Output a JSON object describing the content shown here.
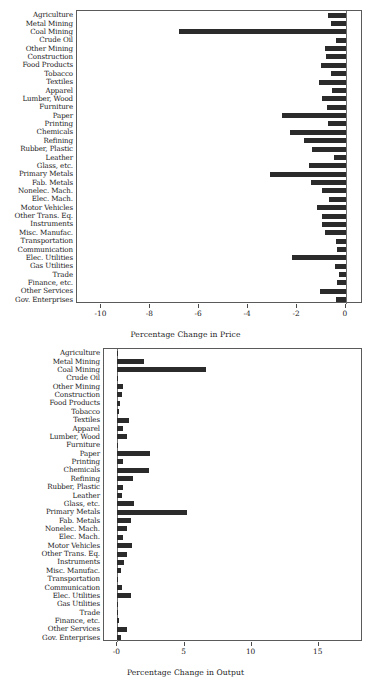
{
  "figure": {
    "background": "#ffffff",
    "bar_color": "#2b2b2b",
    "axis_color": "#5a5a5a"
  },
  "categories": [
    "Agriculture",
    "Metal Mining",
    "Coal Mining",
    "Crude Oil",
    "Other Mining",
    "Construction",
    "Food Products",
    "Tobacco",
    "Textiles",
    "Apparel",
    "Lumber, Wood",
    "Furniture",
    "Paper",
    "Printing",
    "Chemicals",
    "Refining",
    "Rubber, Plastic",
    "Leather",
    "Glass, etc.",
    "Primary Metals",
    "Fab. Metals",
    "Nonelec. Mach.",
    "Elec. Mach.",
    "Motor Vehicles",
    "Other Trans. Eq.",
    "Instruments",
    "Misc. Manufac.",
    "Transportation",
    "Communication",
    "Elec. Utilities",
    "Gas Utilities",
    "Trade",
    "Finance, etc.",
    "Other Services",
    "Gov. Enterprises"
  ],
  "chart_data": [
    {
      "type": "bar",
      "orientation": "horizontal",
      "id": "price",
      "title": "",
      "xlabel": "Percentage Change in Price",
      "ylabel": "",
      "xlim": [
        -11.0,
        0.7
      ],
      "xticks": [
        -10,
        -8,
        -6,
        -4,
        -2,
        0
      ],
      "xticklabels": [
        "-10",
        "-8",
        "-6",
        "-4",
        "-2",
        "0"
      ],
      "grid": false,
      "legend": null,
      "categories": [
        "Agriculture",
        "Metal Mining",
        "Coal Mining",
        "Crude Oil",
        "Other Mining",
        "Construction",
        "Food Products",
        "Tobacco",
        "Textiles",
        "Apparel",
        "Lumber, Wood",
        "Furniture",
        "Paper",
        "Printing",
        "Chemicals",
        "Refining",
        "Rubber, Plastic",
        "Leather",
        "Glass, etc.",
        "Primary Metals",
        "Fab. Metals",
        "Nonelec. Mach.",
        "Elec. Mach.",
        "Motor Vehicles",
        "Other Trans. Eq.",
        "Instruments",
        "Misc. Manufac.",
        "Transportation",
        "Communication",
        "Elec. Utilities",
        "Gas Utilities",
        "Trade",
        "Finance, etc.",
        "Other Services",
        "Gov. Enterprises"
      ],
      "values": [
        -0.72,
        -0.62,
        -6.82,
        -0.4,
        -0.86,
        -0.8,
        -1.0,
        -0.62,
        -1.1,
        -0.58,
        -0.96,
        -0.76,
        -2.62,
        -0.72,
        -2.3,
        -1.72,
        -1.4,
        -0.5,
        -1.52,
        -3.1,
        -1.42,
        -0.96,
        -0.7,
        -1.2,
        -0.96,
        -0.96,
        -0.86,
        -0.4,
        -0.36,
        -2.22,
        -0.46,
        -0.3,
        -0.36,
        -1.04,
        -0.4
      ]
    },
    {
      "type": "bar",
      "orientation": "horizontal",
      "id": "output",
      "title": "",
      "xlabel": "Percentage Change in Output",
      "ylabel": "",
      "xlim": [
        -1.0,
        18.3
      ],
      "xticks": [
        0,
        5,
        10,
        15
      ],
      "xticklabels": [
        "-0",
        "5",
        "10",
        "15"
      ],
      "grid": false,
      "legend": null,
      "categories": [
        "Agriculture",
        "Metal Mining",
        "Coal Mining",
        "Crude Oil",
        "Other Mining",
        "Construction",
        "Food Products",
        "Tobacco",
        "Textiles",
        "Apparel",
        "Lumber, Wood",
        "Furniture",
        "Paper",
        "Printing",
        "Chemicals",
        "Refining",
        "Rubber, Plastic",
        "Leather",
        "Glass, etc.",
        "Primary Metals",
        "Fab. Metals",
        "Nonelec. Mach.",
        "Elec. Mach.",
        "Motor Vehicles",
        "Other Trans. Eq.",
        "Instruments",
        "Misc. Manufac.",
        "Transportation",
        "Communication",
        "Elec. Utilities",
        "Gas Utilities",
        "Trade",
        "Finance, etc.",
        "Other Services",
        "Gov. Enterprises"
      ],
      "values": [
        0.04,
        1.95,
        6.62,
        0.05,
        0.4,
        0.32,
        0.2,
        0.1,
        0.9,
        0.42,
        0.7,
        0.08,
        2.45,
        0.38,
        2.35,
        1.15,
        0.4,
        0.34,
        1.25,
        5.22,
        1.05,
        0.72,
        0.38,
        1.1,
        0.7,
        0.48,
        0.3,
        0.06,
        0.34,
        1.05,
        0.02,
        0.04,
        0.12,
        0.72,
        0.25
      ]
    }
  ]
}
